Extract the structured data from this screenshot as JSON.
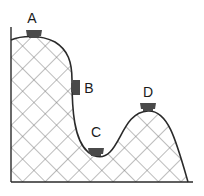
{
  "diagram": {
    "type": "roller-coaster-track-energy",
    "colors": {
      "outline": "#2a2a2a",
      "hatch": "#7a7a7a",
      "cart": "#4a4a4a",
      "background": "#ffffff"
    },
    "positions": [
      {
        "id": "A",
        "label": "A",
        "description": "cart at top of tall hill",
        "label_x": 32,
        "label_y": 18
      },
      {
        "id": "B",
        "label": "B",
        "description": "cart on steep drop",
        "label_x": 89,
        "label_y": 88
      },
      {
        "id": "C",
        "label": "C",
        "description": "cart at bottom of valley",
        "label_x": 96,
        "label_y": 132
      },
      {
        "id": "D",
        "label": "D",
        "description": "cart at top of smaller hill",
        "label_x": 148,
        "label_y": 92
      }
    ]
  }
}
